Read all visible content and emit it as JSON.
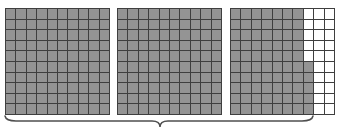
{
  "figure": {
    "type": "base-ten-hundredths-grid-model",
    "grid_rows": 10,
    "grid_columns": 10,
    "squares_per_grid": 100,
    "total_shaded_squares": 275,
    "shaded_value": "2.75",
    "colors": {
      "shaded_fill": "#949494",
      "unshaded_fill": "#ffffff",
      "grid_line": "#3f3f3f",
      "brace_line": "#4f4f4f",
      "background": "#ffffff"
    },
    "grids": [
      {
        "name": "grid-1",
        "label": "",
        "shaded_count": 100,
        "fully_shaded": true,
        "row_shaded_columns": [
          10,
          10,
          10,
          10,
          10,
          10,
          10,
          10,
          10,
          10
        ]
      },
      {
        "name": "grid-2",
        "label": "",
        "shaded_count": 100,
        "fully_shaded": true,
        "row_shaded_columns": [
          10,
          10,
          10,
          10,
          10,
          10,
          10,
          10,
          10,
          10
        ]
      },
      {
        "name": "grid-3",
        "label": "",
        "shaded_count": 75,
        "fully_shaded": false,
        "row_shaded_columns": [
          7,
          7,
          7,
          7,
          7,
          8,
          8,
          8,
          8,
          8
        ]
      }
    ],
    "brace": {
      "name": "total-brace",
      "orientation": "bottom",
      "label": "",
      "spans_grids": [
        "grid-1",
        "grid-2",
        "grid-3"
      ],
      "start_x": 5,
      "end_x": 312,
      "center_x": 160
    }
  }
}
